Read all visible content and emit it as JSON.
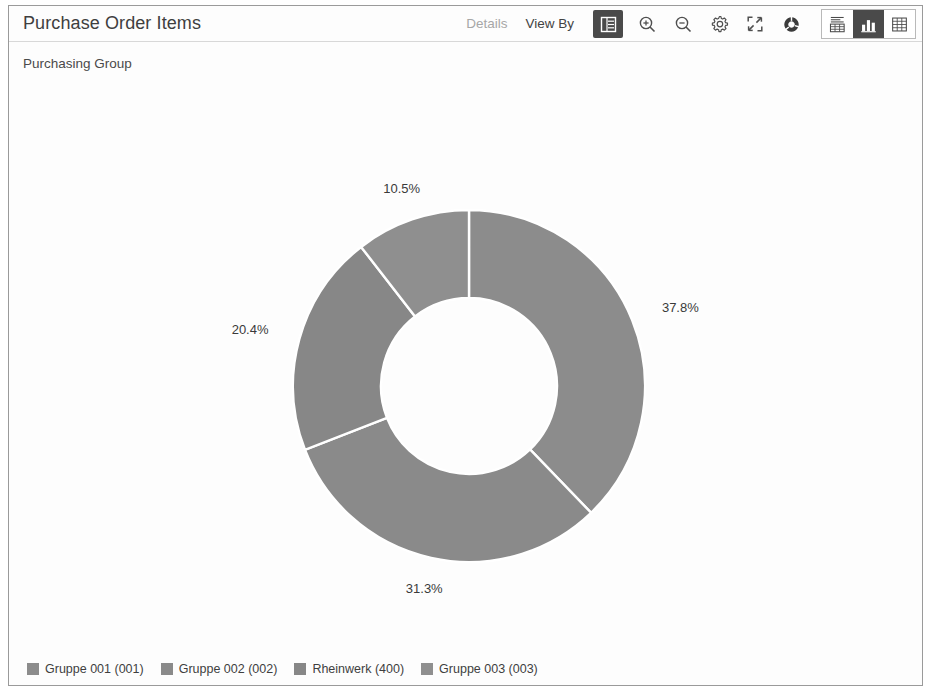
{
  "window": {
    "title": "Purchase Order Items",
    "subtitle": "Purchasing Group"
  },
  "toolbar": {
    "details_label": "Details",
    "view_by_label": "View By",
    "legend_toggle_icon": "legend-list-icon",
    "zoom_in_icon": "zoom-in-icon",
    "zoom_out_icon": "zoom-out-icon",
    "settings_icon": "gear-icon",
    "fullscreen_icon": "fullscreen-icon",
    "chart_type_icon": "donut-chart-icon",
    "segments": [
      {
        "name": "chart-and-table",
        "icon": "chart-table-icon",
        "active": false
      },
      {
        "name": "chart-only",
        "icon": "bar-chart-icon",
        "active": true
      },
      {
        "name": "table-only",
        "icon": "grid-table-icon",
        "active": false
      }
    ]
  },
  "colors": {
    "slice_1": "#8c8c8c",
    "slice_2": "#8a8a8a",
    "slice_3": "#878787",
    "slice_4": "#8f8f8f",
    "accent_dark": "#4a4a4a",
    "border": "#9a9a9a",
    "label_text": "#3a3a3a"
  },
  "chart_data": {
    "type": "pie",
    "variant": "donut",
    "title": "Purchase Order Items",
    "subtitle": "Purchasing Group",
    "measure": "Purchase Order Items",
    "dimension": "Purchasing Group",
    "categories": [
      "Gruppe 001 (001)",
      "Gruppe 002 (002)",
      "Rheinwerk (400)",
      "Gruppe 003 (003)"
    ],
    "values": [
      37.8,
      31.3,
      20.4,
      10.5
    ],
    "unit": "%",
    "data_labels": [
      "37.8%",
      "31.3%",
      "20.4%",
      "10.5%"
    ],
    "colors": [
      "#8c8c8c",
      "#8a8a8a",
      "#878787",
      "#8f8f8f"
    ],
    "start_angle_deg": 0,
    "direction": "clockwise",
    "inner_radius_ratio": 0.5,
    "legend_position": "bottom",
    "grid": false
  },
  "legend": {
    "items": [
      {
        "label": "Gruppe 001 (001)",
        "color": "#8c8c8c"
      },
      {
        "label": "Gruppe 002 (002)",
        "color": "#8a8a8a"
      },
      {
        "label": "Rheinwerk (400)",
        "color": "#878787"
      },
      {
        "label": "Gruppe 003 (003)",
        "color": "#8f8f8f"
      }
    ]
  }
}
